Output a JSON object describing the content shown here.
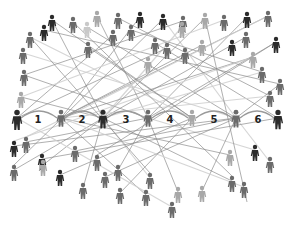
{
  "diagram": {
    "chain_labels": [
      "1",
      "2",
      "3",
      "4",
      "5",
      "6"
    ],
    "colors": {
      "background": "#ffffff",
      "dark": "#2b2b2b",
      "mid": "#6b6b6b",
      "light": "#a8a8a8",
      "pale": "#c9c9c9",
      "line": "#8a8a8a",
      "line_light": "#cfcfcf",
      "arc": "#9a9a9a",
      "label": "#222222"
    },
    "chain": [
      {
        "id": "c0",
        "shade": "dark"
      },
      {
        "id": "c1",
        "shade": "mid"
      },
      {
        "id": "c2",
        "shade": "dark"
      },
      {
        "id": "c3",
        "shade": "mid"
      },
      {
        "id": "c4",
        "shade": "light"
      },
      {
        "id": "c5",
        "shade": "mid"
      },
      {
        "id": "c6",
        "shade": "dark"
      }
    ],
    "people": [
      {
        "id": "p1",
        "shade": "dark"
      },
      {
        "id": "p2",
        "shade": "mid"
      },
      {
        "id": "p3",
        "shade": "light"
      },
      {
        "id": "p4",
        "shade": "mid"
      },
      {
        "id": "p5",
        "shade": "dark"
      },
      {
        "id": "p6",
        "shade": "dark"
      },
      {
        "id": "p7",
        "shade": "mid"
      },
      {
        "id": "p8",
        "shade": "light"
      },
      {
        "id": "p9",
        "shade": "mid"
      },
      {
        "id": "p10",
        "shade": "dark"
      },
      {
        "id": "p11",
        "shade": "mid"
      },
      {
        "id": "p12",
        "shade": "mid"
      },
      {
        "id": "p13",
        "shade": "dark"
      },
      {
        "id": "p14",
        "shade": "pale"
      },
      {
        "id": "p15",
        "shade": "mid"
      },
      {
        "id": "p16",
        "shade": "mid"
      },
      {
        "id": "p17",
        "shade": "mid"
      },
      {
        "id": "p18",
        "shade": "light"
      },
      {
        "id": "p19",
        "shade": "light"
      },
      {
        "id": "p20",
        "shade": "mid"
      },
      {
        "id": "p21",
        "shade": "dark"
      },
      {
        "id": "p22",
        "shade": "mid"
      },
      {
        "id": "p23",
        "shade": "mid"
      },
      {
        "id": "p24",
        "shade": "light"
      },
      {
        "id": "p25",
        "shade": "mid"
      },
      {
        "id": "p26",
        "shade": "mid"
      },
      {
        "id": "p27",
        "shade": "light"
      },
      {
        "id": "p28",
        "shade": "dark"
      },
      {
        "id": "p29",
        "shade": "mid"
      },
      {
        "id": "p30",
        "shade": "mid"
      },
      {
        "id": "p31",
        "shade": "mid"
      },
      {
        "id": "p32",
        "shade": "light"
      },
      {
        "id": "p33",
        "shade": "mid"
      },
      {
        "id": "p34",
        "shade": "dark"
      },
      {
        "id": "p35",
        "shade": "mid"
      },
      {
        "id": "p36",
        "shade": "dark"
      },
      {
        "id": "p37",
        "shade": "mid"
      },
      {
        "id": "p38",
        "shade": "mid"
      },
      {
        "id": "p39",
        "shade": "light"
      },
      {
        "id": "p40",
        "shade": "dark"
      },
      {
        "id": "p41",
        "shade": "mid"
      },
      {
        "id": "p42",
        "shade": "mid"
      },
      {
        "id": "p43",
        "shade": "light"
      },
      {
        "id": "p44",
        "shade": "dark"
      },
      {
        "id": "p45",
        "shade": "mid"
      },
      {
        "id": "p46",
        "shade": "mid"
      },
      {
        "id": "p47",
        "shade": "mid"
      },
      {
        "id": "p48",
        "shade": "mid"
      },
      {
        "id": "p49",
        "shade": "light"
      },
      {
        "id": "p50",
        "shade": "mid"
      },
      {
        "id": "p51",
        "shade": "mid"
      },
      {
        "id": "p52",
        "shade": "mid"
      },
      {
        "id": "p53",
        "shade": "light"
      },
      {
        "id": "p54",
        "shade": "mid"
      },
      {
        "id": "p55",
        "shade": "mid"
      }
    ]
  }
}
